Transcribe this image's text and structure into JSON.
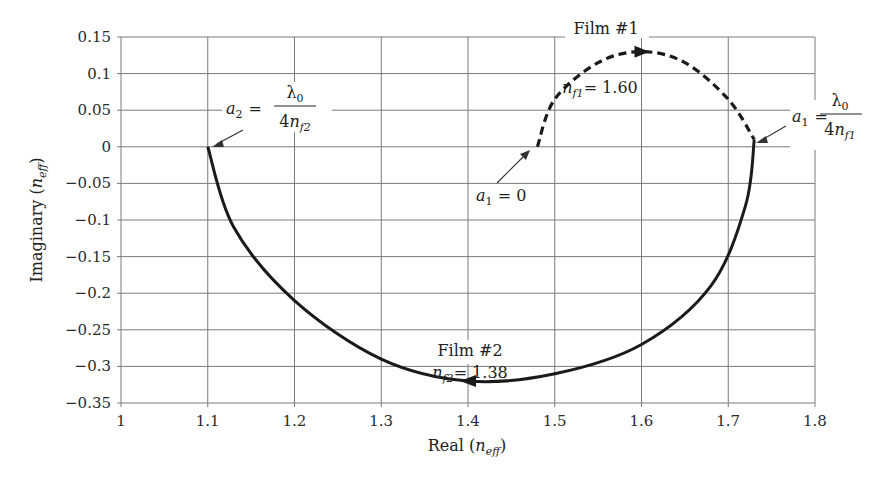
{
  "chart_data": {
    "type": "line",
    "title": "",
    "xlabel": "Real (n_eff)",
    "ylabel": "Imaginary (n_eff)",
    "xlabel_parts": {
      "prefix": "Real (",
      "var": "n",
      "sub": "eff",
      "suffix": ")"
    },
    "ylabel_parts": {
      "prefix": "Imaginary (",
      "var": "n",
      "sub": "eff",
      "suffix": ")"
    },
    "xlim": [
      1,
      1.8
    ],
    "ylim": [
      -0.35,
      0.15
    ],
    "grid": true,
    "x_ticks": [
      "1",
      "1.1",
      "1.2",
      "1.3",
      "1.4",
      "1.5",
      "1.6",
      "1.7",
      "1.8"
    ],
    "y_ticks": [
      "0.15",
      "0.1",
      "0.05",
      "0",
      "−0.05",
      "−0.1",
      "−0.15",
      "−0.2",
      "−0.25",
      "−0.3",
      "−0.35"
    ],
    "series": [
      {
        "name": "Film #1",
        "style": "dashed",
        "index_label": "n_f1 = 1.60",
        "points": [
          [
            1.48,
            0.0
          ],
          [
            1.5,
            0.065
          ],
          [
            1.55,
            0.115
          ],
          [
            1.6,
            0.13
          ],
          [
            1.65,
            0.115
          ],
          [
            1.7,
            0.065
          ],
          [
            1.73,
            0.01
          ]
        ]
      },
      {
        "name": "Film #2",
        "style": "solid",
        "index_label": "n_f2 = 1.38",
        "points": [
          [
            1.73,
            0.01
          ],
          [
            1.72,
            -0.08
          ],
          [
            1.68,
            -0.19
          ],
          [
            1.6,
            -0.27
          ],
          [
            1.5,
            -0.31
          ],
          [
            1.4,
            -0.32
          ],
          [
            1.3,
            -0.29
          ],
          [
            1.2,
            -0.21
          ],
          [
            1.13,
            -0.11
          ],
          [
            1.1,
            0.0
          ]
        ]
      }
    ],
    "annotations": [
      {
        "text": "Film #1",
        "x": 1.6,
        "y": 0.15
      },
      {
        "text": "n_f1 = 1.60",
        "x": 1.6,
        "y": 0.08
      },
      {
        "text": "a1 = 0",
        "x": 1.42,
        "y": -0.05,
        "arrow_to": [
          1.48,
          0.0
        ]
      },
      {
        "text": "a1 = λ0 / 4n_f1",
        "x": 1.78,
        "y": 0.02,
        "arrow_to": [
          1.73,
          0.01
        ]
      },
      {
        "text": "a2 = λ0 / 4n_f2",
        "x": 1.15,
        "y": 0.04,
        "arrow_to": [
          1.1,
          0.0
        ]
      },
      {
        "text": "Film #2",
        "x": 1.4,
        "y": -0.265
      },
      {
        "text": "n_f2 = 1.38",
        "x": 1.4,
        "y": -0.295
      }
    ]
  },
  "labels": {
    "film1": "Film #1",
    "film2": "Film #2",
    "nf1_var": "n",
    "nf1_sub": "f1",
    "nf1_val": "= 1.60",
    "nf2_var": "n",
    "nf2_sub": "f2",
    "nf2_val": "= 1.38",
    "a1zero_var": "a",
    "a1zero_sub": "1",
    "a1zero_val": " = 0",
    "a1_var": "a",
    "a1_sub": "1",
    "a2_var": "a",
    "a2_sub": "2",
    "eq": "=",
    "lambda": "λ",
    "lambda_sub": "0",
    "four": "4",
    "n": "n",
    "f1": "f1",
    "f2": "f2"
  }
}
